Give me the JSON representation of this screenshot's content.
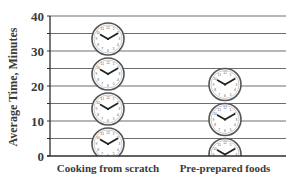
{
  "chart_data": {
    "type": "bar",
    "style": "pictograph",
    "pictogram": "clock-icon",
    "minutes_per_icon": 10,
    "title": "",
    "xlabel": "",
    "ylabel": "Average Time, Minutes",
    "categories": [
      "Cooking from scratch",
      "Pre-prepared foods"
    ],
    "values": [
      38,
      25
    ],
    "ylim": [
      0,
      40
    ],
    "yticks": [
      0,
      10,
      20,
      30,
      40
    ],
    "grid": true,
    "grid_step": 5,
    "legend": null
  },
  "colors": {
    "gridline": "#6e6e6e",
    "axis": "#2e2e2e",
    "text": "#3a3a3a",
    "clock_rim": "#555555",
    "clock_face": "#ffffff",
    "clock_hands": "#222222"
  }
}
